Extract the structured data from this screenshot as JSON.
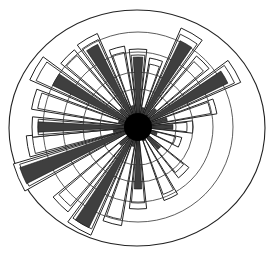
{
  "chart_data": {
    "type": "rose",
    "title": "",
    "xlabel": "",
    "ylabel": "",
    "grid": true,
    "legend": null,
    "center": [
      138,
      127
    ],
    "outer_ellipse": {
      "rx": 128,
      "ry": 118
    },
    "ring_radii": [
      38,
      55,
      75,
      95
    ],
    "colors": {
      "fill": "#3f3f3f",
      "outline": "#222222",
      "background": "#ffffff"
    },
    "sectors": [
      {
        "angle": -90,
        "width": 10,
        "value": 70,
        "outline": 78
      },
      {
        "angle": -75,
        "width": 8,
        "value": 20,
        "outline": 70
      },
      {
        "angle": -60,
        "width": 10,
        "value": 96,
        "outline": 108
      },
      {
        "angle": -45,
        "width": 8,
        "value": 25,
        "outline": 92
      },
      {
        "angle": -30,
        "width": 10,
        "value": 100,
        "outline": 112
      },
      {
        "angle": -15,
        "width": 8,
        "value": 30,
        "outline": 80
      },
      {
        "angle": 0,
        "width": 10,
        "value": 35,
        "outline": 55
      },
      {
        "angle": 20,
        "width": 10,
        "value": 20,
        "outline": 45
      },
      {
        "angle": 45,
        "width": 10,
        "value": 30,
        "outline": 65
      },
      {
        "angle": 65,
        "width": 8,
        "value": 15,
        "outline": 78
      },
      {
        "angle": 90,
        "width": 9,
        "value": 62,
        "outline": 82
      },
      {
        "angle": 105,
        "width": 8,
        "value": 20,
        "outline": 100
      },
      {
        "angle": 120,
        "width": 10,
        "value": 112,
        "outline": 118
      },
      {
        "angle": 135,
        "width": 8,
        "value": 25,
        "outline": 110
      },
      {
        "angle": 157,
        "width": 10,
        "value": 125,
        "outline": 130
      },
      {
        "angle": 170,
        "width": 8,
        "value": 25,
        "outline": 112
      },
      {
        "angle": 180,
        "width": 8,
        "value": 100,
        "outline": 106
      },
      {
        "angle": 195,
        "width": 8,
        "value": 20,
        "outline": 108
      },
      {
        "angle": 210,
        "width": 10,
        "value": 95,
        "outline": 118
      },
      {
        "angle": 225,
        "width": 8,
        "value": 25,
        "outline": 100
      },
      {
        "angle": 240,
        "width": 10,
        "value": 92,
        "outline": 102
      },
      {
        "angle": 255,
        "width": 8,
        "value": 22,
        "outline": 82
      }
    ]
  }
}
